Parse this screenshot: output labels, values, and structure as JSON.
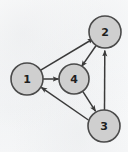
{
  "figure": {
    "kind": "directed-graph",
    "width": 128,
    "height": 152,
    "background_color": "#fdfdfd",
    "node_fill_color": "#cfcfcf",
    "node_stroke_color": "#4a4a4a",
    "edge_color": "#3a3a3a",
    "label_color": "#1f1f1f"
  },
  "nodes": [
    {
      "id": "1",
      "label": "1",
      "cx": 27,
      "cy": 79,
      "r": 16
    },
    {
      "id": "2",
      "label": "2",
      "cx": 105,
      "cy": 32,
      "r": 16
    },
    {
      "id": "3",
      "label": "3",
      "cx": 104,
      "cy": 126,
      "r": 16
    },
    {
      "id": "4",
      "label": "4",
      "cx": 74,
      "cy": 79,
      "r": 15
    }
  ],
  "edges": [
    {
      "from": "1",
      "to": "2",
      "directed": true
    },
    {
      "from": "1",
      "to": "4",
      "directed": true
    },
    {
      "from": "2",
      "to": "4",
      "directed": true
    },
    {
      "from": "4",
      "to": "3",
      "directed": true
    },
    {
      "from": "3",
      "to": "2",
      "directed": true
    },
    {
      "from": "3",
      "to": "1",
      "directed": true
    }
  ]
}
